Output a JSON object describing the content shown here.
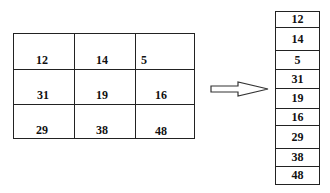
{
  "matrix": {
    "rows": [
      [
        "12",
        "14",
        "5"
      ],
      [
        "31",
        "19",
        "16"
      ],
      [
        "29",
        "38",
        "48"
      ]
    ]
  },
  "arrow": {
    "direction": "right"
  },
  "column": {
    "values": [
      "12",
      "14",
      "5",
      "31",
      "19",
      "16",
      "29",
      "38",
      "48"
    ]
  }
}
